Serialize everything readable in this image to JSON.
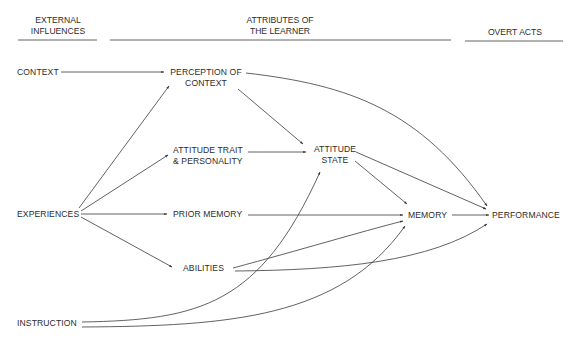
{
  "headers": {
    "external": [
      "EXTERNAL",
      "INFLUENCES"
    ],
    "learner": [
      "ATTRIBUTES OF",
      "THE LEARNER"
    ],
    "overt": "OVERT ACTS"
  },
  "nodes": {
    "context": "CONTEXT",
    "experiences": "EXPERIENCES",
    "instruction": "INSTRUCTION",
    "perception": [
      "PERCEPTION OF",
      "CONTEXT"
    ],
    "attitude_trait": [
      "ATTITUDE TRAIT",
      "& PERSONALITY"
    ],
    "prior_memory": "PRIOR MEMORY",
    "abilities": "ABILITIES",
    "attitude_state": [
      "ATTITUDE",
      "STATE"
    ],
    "memory": "MEMORY",
    "performance": "PERFORMANCE"
  },
  "edges": [
    [
      "context",
      "perception"
    ],
    [
      "experiences",
      "perception"
    ],
    [
      "experiences",
      "attitude_trait"
    ],
    [
      "experiences",
      "prior_memory"
    ],
    [
      "experiences",
      "abilities"
    ],
    [
      "perception",
      "attitude_state"
    ],
    [
      "perception",
      "performance"
    ],
    [
      "attitude_trait",
      "attitude_state"
    ],
    [
      "prior_memory",
      "memory"
    ],
    [
      "attitude_state",
      "memory"
    ],
    [
      "attitude_state",
      "performance"
    ],
    [
      "abilities",
      "memory"
    ],
    [
      "abilities",
      "performance"
    ],
    [
      "memory",
      "performance"
    ],
    [
      "instruction",
      "attitude_state"
    ],
    [
      "instruction",
      "memory"
    ]
  ],
  "colors": {
    "line": "#333333",
    "text": "#2c2c2c"
  }
}
